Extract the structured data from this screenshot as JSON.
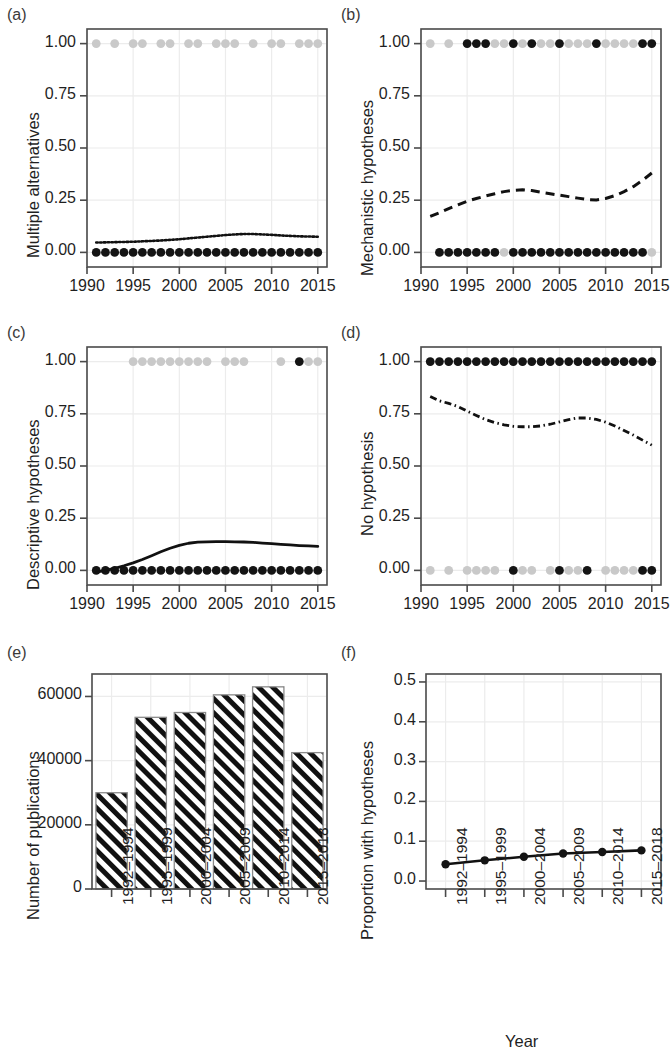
{
  "figure": {
    "panels": [
      "(a)",
      "(b)",
      "(c)",
      "(d)",
      "(e)",
      "(f)"
    ],
    "shared_xlabel": "Year"
  },
  "chart_data": [
    {
      "id": "a",
      "panel_label": "(a)",
      "type": "line",
      "title": "",
      "xlabel": "",
      "ylabel": "Multiple alternatives",
      "xlim": [
        1990.0,
        2016.0
      ],
      "ylim": [
        -0.07,
        1.07
      ],
      "xticks": [
        1990,
        1995,
        2000,
        2005,
        2010,
        2015
      ],
      "xticklabels": [
        "1990",
        "1995",
        "2000",
        "2005",
        "2010",
        "2015"
      ],
      "yticks": [
        0.0,
        0.25,
        0.5,
        0.75,
        1.0
      ],
      "yticklabels": [
        "0.00",
        "0.25",
        "0.50",
        "0.75",
        "1.00"
      ],
      "grid": true,
      "legend": "none",
      "series": [
        {
          "name": "fitted proportion",
          "style": "dotted",
          "x": [
            1991,
            1992,
            1993,
            1994,
            1995,
            1996,
            1997,
            1998,
            1999,
            2000,
            2001,
            2002,
            2003,
            2004,
            2005,
            2006,
            2007,
            2008,
            2009,
            2010,
            2011,
            2012,
            2013,
            2014,
            2015
          ],
          "values": [
            0.047,
            0.048,
            0.049,
            0.05,
            0.051,
            0.053,
            0.055,
            0.057,
            0.06,
            0.063,
            0.067,
            0.071,
            0.075,
            0.079,
            0.083,
            0.086,
            0.088,
            0.088,
            0.086,
            0.084,
            0.081,
            0.079,
            0.077,
            0.076,
            0.075
          ]
        },
        {
          "name": "observations at 0 (dark)",
          "style": "points-dark",
          "x": [
            1991,
            1992,
            1993,
            1994,
            1995,
            1996,
            1997,
            1998,
            1999,
            2000,
            2001,
            2002,
            2003,
            2004,
            2005,
            2006,
            2007,
            2008,
            2009,
            2010,
            2011,
            2012,
            2013,
            2014,
            2015
          ],
          "values": [
            0,
            0,
            0,
            0,
            0,
            0,
            0,
            0,
            0,
            0,
            0,
            0,
            0,
            0,
            0,
            0,
            0,
            0,
            0,
            0,
            0,
            0,
            0,
            0,
            0
          ]
        },
        {
          "name": "observations at 1 (faint)",
          "style": "points-faint",
          "x": [
            1991,
            1993,
            1995,
            1996,
            1998,
            1999,
            2001,
            2002,
            2004,
            2005,
            2006,
            2008,
            2010,
            2011,
            2013,
            2014,
            2015
          ],
          "values": [
            1,
            1,
            1,
            1,
            1,
            1,
            1,
            1,
            1,
            1,
            1,
            1,
            1,
            1,
            1,
            1,
            1
          ]
        }
      ]
    },
    {
      "id": "b",
      "panel_label": "(b)",
      "type": "line",
      "title": "",
      "xlabel": "",
      "ylabel": "Mechanistic hypotheses",
      "xlim": [
        1990.0,
        2016.0
      ],
      "ylim": [
        -0.07,
        1.07
      ],
      "xticks": [
        1990,
        1995,
        2000,
        2005,
        2010,
        2015
      ],
      "xticklabels": [
        "1990",
        "1995",
        "2000",
        "2005",
        "2010",
        "2015"
      ],
      "yticks": [
        0.0,
        0.25,
        0.5,
        0.75,
        1.0
      ],
      "yticklabels": [
        "0.00",
        "0.25",
        "0.50",
        "0.75",
        "1.00"
      ],
      "grid": true,
      "legend": "none",
      "series": [
        {
          "name": "fitted proportion",
          "style": "dashed",
          "x": [
            1991,
            1992,
            1993,
            1994,
            1995,
            1996,
            1997,
            1998,
            1999,
            2000,
            2001,
            2002,
            2003,
            2004,
            2005,
            2006,
            2007,
            2008,
            2009,
            2010,
            2011,
            2012,
            2013,
            2014,
            2015
          ],
          "values": [
            0.172,
            0.19,
            0.21,
            0.228,
            0.245,
            0.258,
            0.27,
            0.281,
            0.291,
            0.297,
            0.3,
            0.296,
            0.288,
            0.281,
            0.274,
            0.267,
            0.26,
            0.253,
            0.251,
            0.258,
            0.272,
            0.291,
            0.315,
            0.345,
            0.38
          ]
        },
        {
          "name": "observations at 0 (dark)",
          "style": "points-dark",
          "x": [
            1992,
            1993,
            1994,
            1995,
            1996,
            1997,
            1998,
            2000,
            2001,
            2002,
            2003,
            2004,
            2005,
            2006,
            2007,
            2008,
            2009,
            2010,
            2011,
            2012,
            2013,
            2014
          ],
          "values": [
            0,
            0,
            0,
            0,
            0,
            0,
            0,
            0,
            0,
            0,
            0,
            0,
            0,
            0,
            0,
            0,
            0,
            0,
            0,
            0,
            0,
            0
          ]
        },
        {
          "name": "observations at 0 (faint)",
          "style": "points-faint",
          "x": [
            1999,
            2015
          ],
          "values": [
            0,
            0
          ]
        },
        {
          "name": "observations at 1 (dark)",
          "style": "points-dark",
          "x": [
            1995,
            1996,
            1997,
            2000,
            2002,
            2005,
            2009,
            2014,
            2015
          ],
          "values": [
            1,
            1,
            1,
            1,
            1,
            1,
            1,
            1,
            1
          ]
        },
        {
          "name": "observations at 1 (faint)",
          "style": "points-faint",
          "x": [
            1991,
            1993,
            1998,
            1999,
            2001,
            2003,
            2004,
            2006,
            2007,
            2008,
            2010,
            2011,
            2012,
            2013
          ],
          "values": [
            1,
            1,
            1,
            1,
            1,
            1,
            1,
            1,
            1,
            1,
            1,
            1,
            1,
            1
          ]
        }
      ]
    },
    {
      "id": "c",
      "panel_label": "(c)",
      "type": "line",
      "title": "",
      "xlabel": "",
      "ylabel": "Descriptive hypotheses",
      "xlim": [
        1990.0,
        2016.0
      ],
      "ylim": [
        -0.07,
        1.07
      ],
      "xticks": [
        1990,
        1995,
        2000,
        2005,
        2010,
        2015
      ],
      "xticklabels": [
        "1990",
        "1995",
        "2000",
        "2005",
        "2010",
        "2015"
      ],
      "yticks": [
        0.0,
        0.25,
        0.5,
        0.75,
        1.0
      ],
      "yticklabels": [
        "0.00",
        "0.25",
        "0.50",
        "0.75",
        "1.00"
      ],
      "grid": true,
      "legend": "none",
      "series": [
        {
          "name": "fitted proportion",
          "style": "solid",
          "x": [
            1991,
            1992,
            1993,
            1994,
            1995,
            1996,
            1997,
            1998,
            1999,
            2000,
            2001,
            2002,
            2003,
            2004,
            2005,
            2006,
            2007,
            2008,
            2009,
            2010,
            2011,
            2012,
            2013,
            2014,
            2015
          ],
          "values": [
            -0.008,
            0.0,
            0.01,
            0.022,
            0.036,
            0.052,
            0.07,
            0.089,
            0.106,
            0.12,
            0.13,
            0.135,
            0.137,
            0.138,
            0.138,
            0.137,
            0.136,
            0.134,
            0.131,
            0.128,
            0.125,
            0.122,
            0.119,
            0.117,
            0.115
          ]
        },
        {
          "name": "observations at 0 (dark)",
          "style": "points-dark",
          "x": [
            1991,
            1992,
            1993,
            1994,
            1995,
            1996,
            1997,
            1998,
            1999,
            2000,
            2001,
            2002,
            2003,
            2004,
            2005,
            2006,
            2007,
            2008,
            2009,
            2010,
            2011,
            2012,
            2013,
            2014,
            2015
          ],
          "values": [
            0,
            0,
            0,
            0,
            0,
            0,
            0,
            0,
            0,
            0,
            0,
            0,
            0,
            0,
            0,
            0,
            0,
            0,
            0,
            0,
            0,
            0,
            0,
            0,
            0
          ]
        },
        {
          "name": "observations at 1 (dark)",
          "style": "points-dark",
          "x": [
            2013
          ],
          "values": [
            1
          ]
        },
        {
          "name": "observations at 1 (faint)",
          "style": "points-faint",
          "x": [
            1995,
            1996,
            1997,
            1998,
            1999,
            2000,
            2001,
            2002,
            2003,
            2005,
            2006,
            2007,
            2011,
            2014,
            2015
          ],
          "values": [
            1,
            1,
            1,
            1,
            1,
            1,
            1,
            1,
            1,
            1,
            1,
            1,
            1,
            1,
            1
          ]
        }
      ]
    },
    {
      "id": "d",
      "panel_label": "(d)",
      "type": "line",
      "title": "",
      "xlabel": "",
      "ylabel": "No hypothesis",
      "xlim": [
        1990.0,
        2016.0
      ],
      "ylim": [
        -0.07,
        1.07
      ],
      "xticks": [
        1990,
        1995,
        2000,
        2005,
        2010,
        2015
      ],
      "xticklabels": [
        "1990",
        "1995",
        "2000",
        "2005",
        "2010",
        "2015"
      ],
      "yticks": [
        0.0,
        0.25,
        0.5,
        0.75,
        1.0
      ],
      "yticklabels": [
        "0.00",
        "0.25",
        "0.50",
        "0.75",
        "1.00"
      ],
      "grid": true,
      "legend": "none",
      "series": [
        {
          "name": "fitted proportion",
          "style": "dashdot",
          "x": [
            1991,
            1992,
            1993,
            1994,
            1995,
            1996,
            1997,
            1998,
            1999,
            2000,
            2001,
            2002,
            2003,
            2004,
            2005,
            2006,
            2007,
            2008,
            2009,
            2010,
            2011,
            2012,
            2013,
            2014,
            2015
          ],
          "values": [
            0.833,
            0.812,
            0.8,
            0.785,
            0.763,
            0.742,
            0.722,
            0.708,
            0.697,
            0.69,
            0.688,
            0.688,
            0.692,
            0.7,
            0.711,
            0.722,
            0.73,
            0.73,
            0.723,
            0.71,
            0.692,
            0.67,
            0.648,
            0.624,
            0.6
          ]
        },
        {
          "name": "observations at 1 (dark)",
          "style": "points-dark",
          "x": [
            1991,
            1992,
            1993,
            1994,
            1995,
            1996,
            1997,
            1998,
            1999,
            2000,
            2001,
            2002,
            2003,
            2004,
            2005,
            2006,
            2007,
            2008,
            2009,
            2010,
            2011,
            2012,
            2013,
            2014,
            2015
          ],
          "values": [
            1,
            1,
            1,
            1,
            1,
            1,
            1,
            1,
            1,
            1,
            1,
            1,
            1,
            1,
            1,
            1,
            1,
            1,
            1,
            1,
            1,
            1,
            1,
            1,
            1
          ]
        },
        {
          "name": "observations at 0 (dark)",
          "style": "points-dark",
          "x": [
            2000,
            2005,
            2008,
            2014,
            2015
          ],
          "values": [
            0,
            0,
            0,
            0,
            0
          ]
        },
        {
          "name": "observations at 0 (faint)",
          "style": "points-faint",
          "x": [
            1991,
            1993,
            1995,
            1996,
            1997,
            1998,
            2001,
            2002,
            2004,
            2006,
            2007,
            2010,
            2011,
            2012,
            2013
          ],
          "values": [
            0,
            0,
            0,
            0,
            0,
            0,
            0,
            0,
            0,
            0,
            0,
            0,
            0,
            0,
            0
          ]
        }
      ]
    },
    {
      "id": "e",
      "panel_label": "(e)",
      "type": "bar",
      "title": "",
      "xlabel": "",
      "ylabel": "Number of publications",
      "categories": [
        "1992–1994",
        "1995–1999",
        "2000–2004",
        "2005–2009",
        "2010–2014",
        "2015–2018"
      ],
      "values": [
        30000,
        53500,
        55000,
        60500,
        63000,
        42500
      ],
      "yticks": [
        0,
        20000,
        40000,
        60000
      ],
      "yticklabels": [
        "0",
        "20000",
        "40000",
        "60000"
      ],
      "ylim": [
        0,
        67000
      ],
      "grid": true,
      "legend": "none",
      "bar_fill": "diagonal-hatch"
    },
    {
      "id": "f",
      "panel_label": "(f)",
      "type": "line",
      "title": "",
      "xlabel": "Year",
      "ylabel": "Proportion with hypotheses",
      "categories": [
        "1992–1994",
        "1995–1999",
        "2000–2004",
        "2005–2009",
        "2010–2014",
        "2015–2018"
      ],
      "values": [
        0.042,
        0.052,
        0.061,
        0.069,
        0.073,
        0.077
      ],
      "yticks": [
        0.0,
        0.1,
        0.2,
        0.3,
        0.4,
        0.5
      ],
      "yticklabels": [
        "0.0",
        "0.1",
        "0.2",
        "0.3",
        "0.4",
        "0.5"
      ],
      "ylim": [
        -0.02,
        0.52
      ],
      "grid": true,
      "legend": "none",
      "marker": "filled-circle",
      "line_style": "solid"
    }
  ],
  "colors": {
    "axis": "#4a4a4a",
    "text": "#1f1f1f",
    "line": "#111111",
    "point_dark": "#141414",
    "point_faint": "#c9c9c9",
    "grid": "#ececec",
    "bar_edge": "#8a8a8a",
    "bar_hatch": "#111111"
  }
}
